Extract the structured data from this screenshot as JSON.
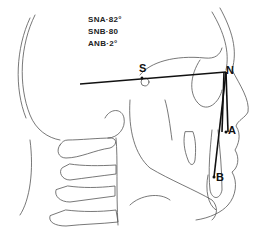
{
  "diagram": {
    "type": "cephalometric tracing",
    "measurements": [
      {
        "label": "SNA",
        "text": "SNA·82°",
        "value": 82,
        "unit": "°"
      },
      {
        "label": "SNB",
        "text": "SNB·80",
        "value": 80,
        "unit": ""
      },
      {
        "label": "ANB",
        "text": "ANB·2°",
        "value": 2,
        "unit": "°"
      }
    ],
    "landmarks": {
      "S": "S",
      "N": "N",
      "A": "A",
      "B": "B"
    },
    "colors": {
      "lines": "#111111",
      "outline": "#555555",
      "background": "#ffffff"
    }
  }
}
